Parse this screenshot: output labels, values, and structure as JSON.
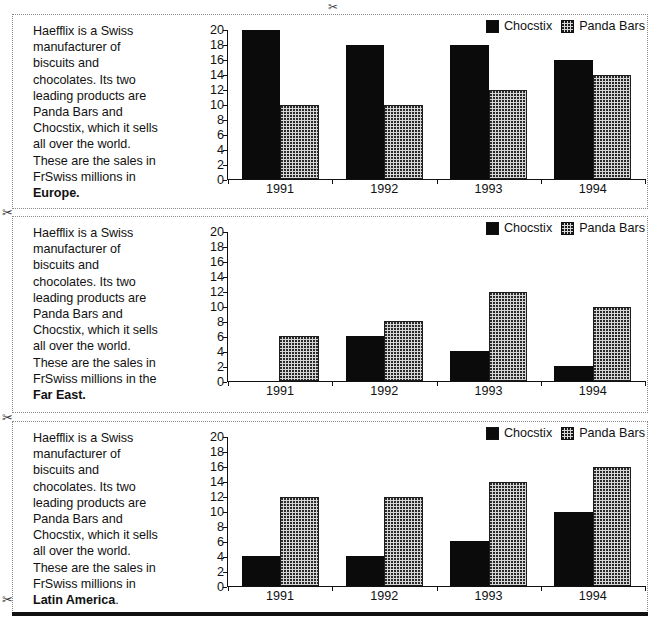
{
  "cut_marks": {
    "scissors_glyph": "✂",
    "positions": [
      "top-center",
      "left-after-panel-1",
      "left-after-panel-2",
      "left-after-panel-3"
    ]
  },
  "legend": {
    "series": [
      {
        "label": "Chocstix",
        "swatch": "solid-black-swatch",
        "color": "#0b0b0b"
      },
      {
        "label": "Panda Bars",
        "swatch": "dotted-gray-swatch",
        "color": "#d6d6d6"
      }
    ]
  },
  "axis": {
    "y_ticks": [
      "20",
      "18",
      "16",
      "14",
      "12",
      "10",
      "8",
      "6",
      "4",
      "2",
      "0"
    ],
    "y_min": 0,
    "y_max": 20,
    "y_step": 2,
    "x_categories": [
      "1991",
      "1992",
      "1993",
      "1994"
    ]
  },
  "panels": [
    {
      "blurb_lines": [
        "Haefflix is a Swiss",
        "manufacturer of",
        "biscuits and",
        "chocolates. Its two",
        "leading products are",
        "Panda Bars and",
        "Chocstix, which it sells",
        "all over the world.",
        "These are the sales in",
        "FrSwiss millions in"
      ],
      "region": "Europe.",
      "region_bold": true,
      "trailing_text": ""
    },
    {
      "blurb_lines": [
        "Haefflix is a Swiss",
        "manufacturer of",
        "biscuits and",
        "chocolates. Its two",
        "leading products are",
        "Panda Bars and",
        "Chocstix, which it sells",
        "all over the world.",
        "These are the sales in",
        "FrSwiss millions in the"
      ],
      "region": "Far East.",
      "region_bold": true,
      "trailing_text": ""
    },
    {
      "blurb_lines": [
        "Haefflix is a Swiss",
        "manufacturer of",
        "biscuits and",
        "chocolates. Its two",
        "leading products are",
        "Panda Bars and",
        "Chocstix, which it sells",
        "all over the world.",
        "These are the sales in",
        "FrSwiss millions in"
      ],
      "region": "Latin America",
      "region_bold": true,
      "trailing_text": "."
    }
  ],
  "chart_data": [
    {
      "type": "bar",
      "title": "Europe",
      "categories": [
        "1991",
        "1992",
        "1993",
        "1994"
      ],
      "series": [
        {
          "name": "Chocstix",
          "values": [
            20,
            18,
            18,
            16
          ]
        },
        {
          "name": "Panda Bars",
          "values": [
            10,
            10,
            12,
            14
          ]
        }
      ],
      "xlabel": "",
      "ylabel": "",
      "ylim": [
        0,
        20
      ],
      "ytick_step": 2,
      "grid": false,
      "legend_position": "top-right",
      "units": "FrSwiss millions"
    },
    {
      "type": "bar",
      "title": "Far East",
      "categories": [
        "1991",
        "1992",
        "1993",
        "1994"
      ],
      "series": [
        {
          "name": "Chocstix",
          "values": [
            0,
            6,
            4,
            2
          ]
        },
        {
          "name": "Panda Bars",
          "values": [
            6,
            8,
            12,
            10
          ]
        }
      ],
      "xlabel": "",
      "ylabel": "",
      "ylim": [
        0,
        20
      ],
      "ytick_step": 2,
      "grid": false,
      "legend_position": "top-right",
      "units": "FrSwiss millions"
    },
    {
      "type": "bar",
      "title": "Latin America",
      "categories": [
        "1991",
        "1992",
        "1993",
        "1994"
      ],
      "series": [
        {
          "name": "Chocstix",
          "values": [
            4,
            4,
            6,
            10
          ]
        },
        {
          "name": "Panda Bars",
          "values": [
            12,
            12,
            14,
            16
          ]
        }
      ],
      "xlabel": "",
      "ylabel": "",
      "ylim": [
        0,
        20
      ],
      "ytick_step": 2,
      "grid": false,
      "legend_position": "top-right",
      "units": "FrSwiss millions"
    }
  ]
}
